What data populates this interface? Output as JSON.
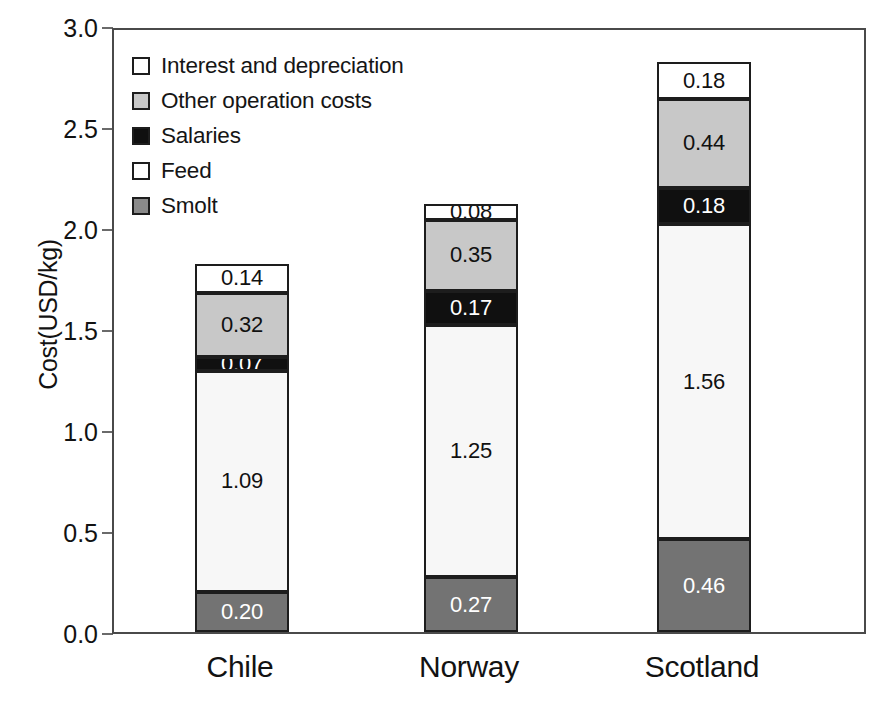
{
  "chart_data": {
    "type": "bar",
    "subtype": "stacked-bar",
    "title": "",
    "xlabel": "",
    "ylabel": "Cost(USD/kg)",
    "categories": [
      "Chile",
      "Norway",
      "Scotland"
    ],
    "ylim": [
      0.0,
      3.0
    ],
    "ytick_values": [
      0.0,
      0.5,
      1.0,
      1.5,
      2.0,
      2.5,
      3.0
    ],
    "ytick_labels": [
      "0.0",
      "0.5",
      "1.0",
      "1.5",
      "2.0",
      "2.5",
      "3.0"
    ],
    "grid": false,
    "legend_position": "upper-left-inside",
    "stack_order_bottom_to_top": [
      "Smolt",
      "Feed",
      "Salaries",
      "Other operation costs",
      "Interest and depreciation"
    ],
    "series": [
      {
        "name": "Smolt",
        "color": "#737373",
        "label_color": "#ffffff",
        "values": [
          0.2,
          0.27,
          0.46
        ],
        "value_labels": [
          "0.20",
          "0.27",
          "0.46"
        ]
      },
      {
        "name": "Feed",
        "color": "#f7f7f7",
        "label_color": "#111111",
        "values": [
          1.09,
          1.25,
          1.56
        ],
        "value_labels": [
          "1.09",
          "1.25",
          "1.56"
        ]
      },
      {
        "name": "Salaries",
        "color": "#101010",
        "label_color": "#ffffff",
        "values": [
          0.07,
          0.17,
          0.18
        ],
        "value_labels": [
          "0.07",
          "0.17",
          "0.18"
        ]
      },
      {
        "name": "Other operation costs",
        "color": "#c8c8c8",
        "label_color": "#111111",
        "values": [
          0.32,
          0.35,
          0.44
        ],
        "value_labels": [
          "0.32",
          "0.35",
          "0.44"
        ]
      },
      {
        "name": "Interest and depreciation",
        "color": "#ffffff",
        "label_color": "#111111",
        "values": [
          0.14,
          0.08,
          0.18
        ],
        "value_labels": [
          "0.14",
          "0.08",
          "0.18"
        ]
      }
    ],
    "totals": [
      1.82,
      2.12,
      2.82
    ],
    "legend_entries": [
      {
        "label": "Interest and depreciation",
        "color": "#ffffff"
      },
      {
        "label": "Other operation costs",
        "color": "#c8c8c8"
      },
      {
        "label": "Salaries",
        "color": "#101010"
      },
      {
        "label": "Feed",
        "color": "#ffffff"
      },
      {
        "label": "Smolt",
        "color": "#8a8a8a"
      }
    ]
  },
  "axis": {
    "y_title": "Cost(USD/kg)"
  },
  "colors": {
    "axis_line": "#4a4a4a",
    "segment_border": "#1d1d1d",
    "text": "#121212",
    "background": "#ffffff"
  }
}
